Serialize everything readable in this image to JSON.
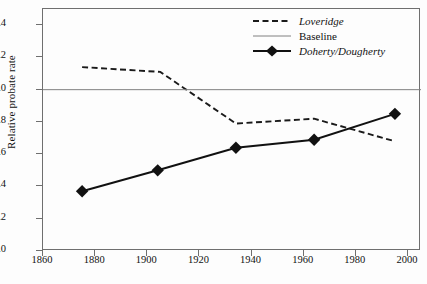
{
  "chart_data": {
    "type": "line",
    "title": "",
    "xlabel": "",
    "ylabel": "Relative probate rate",
    "xlim": [
      1860,
      2005
    ],
    "ylim": [
      0.0,
      1.5
    ],
    "grid": false,
    "legend_position": "top-right",
    "x_ticks": [
      1860,
      1880,
      1900,
      1920,
      1940,
      1960,
      1980,
      2000
    ],
    "x_tick_labels": [
      "1860",
      "1880",
      "1900",
      "1920",
      "1940",
      "1960",
      "1980",
      "2000"
    ],
    "y_ticks": [
      0.0,
      0.2,
      0.4,
      0.6,
      0.8,
      1.0,
      1.2,
      1.4
    ],
    "y_tick_labels": [
      "0.0",
      "0.2",
      "0.4",
      "0.6",
      "0.8",
      "1.0",
      "1.2",
      "1.4"
    ],
    "series": [
      {
        "name": "Loveridge",
        "style": "dashed",
        "marker": "none",
        "color": "#1a1a1a",
        "x": [
          1875,
          1905,
          1934,
          1964,
          1995
        ],
        "values": [
          1.14,
          1.11,
          0.79,
          0.82,
          0.68
        ]
      },
      {
        "name": "Baseline",
        "style": "solid-thin",
        "marker": "none",
        "color": "#808080",
        "x": [
          1860,
          2005
        ],
        "values": [
          1.0,
          1.0
        ]
      },
      {
        "name": "Doherty/Dougherty",
        "style": "solid",
        "marker": "diamond",
        "color": "#111111",
        "x": [
          1875,
          1904,
          1934,
          1964,
          1995
        ],
        "values": [
          0.37,
          0.5,
          0.64,
          0.69,
          0.85
        ]
      }
    ],
    "annotations": []
  },
  "legend": {
    "items": [
      {
        "label": "Loveridge",
        "style": "dashed",
        "italic": true
      },
      {
        "label": "Baseline",
        "style": "solid-thin",
        "italic": false
      },
      {
        "label": "Doherty/Dougherty",
        "style": "diamond-line",
        "italic": true
      }
    ]
  },
  "colors": {
    "background": "#fdfdfd",
    "axis": "#6f6f6f",
    "series_primary": "#111111",
    "baseline": "#808080"
  }
}
